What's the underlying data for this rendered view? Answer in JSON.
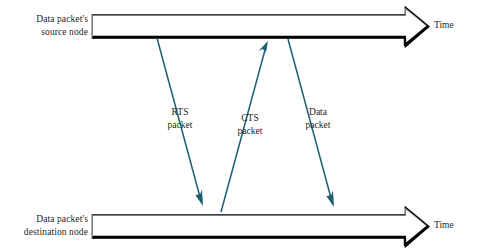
{
  "diagram": {
    "colors": {
      "arrow_line": "#1d5f72",
      "axis_outline": "#6f6f6f",
      "axis_shadow": "#000000",
      "text": "#231f20",
      "background": "#ffffff"
    },
    "timelines": [
      {
        "id": "source",
        "label_line1": "Data packet's",
        "label_line2": "source node",
        "time_label": "Time"
      },
      {
        "id": "destination",
        "label_line1": "Data packet's",
        "label_line2": "destination node",
        "time_label": "Time"
      }
    ],
    "messages": [
      {
        "id": "rts",
        "label_line1": "RTS",
        "label_line2": "packet",
        "direction": "source-to-destination"
      },
      {
        "id": "cts",
        "label_line1": "CTS",
        "label_line2": "packet",
        "direction": "destination-to-source"
      },
      {
        "id": "data",
        "label_line1": "Data",
        "label_line2": "packet",
        "direction": "source-to-destination"
      }
    ]
  }
}
